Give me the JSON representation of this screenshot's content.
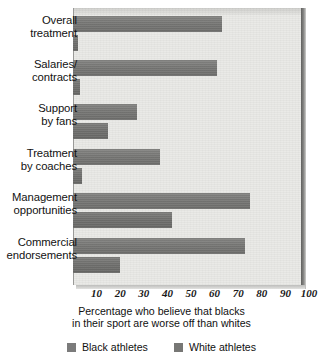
{
  "chart_data": {
    "type": "bar",
    "orientation": "horizontal",
    "title": "",
    "subtitle": "",
    "xlabel": "Percentage who believe that  blacks in their sport are worse off than whites",
    "ylabel": "",
    "xlim": [
      0,
      100
    ],
    "grid": false,
    "legend_position": "bottom",
    "categories": [
      "Overall treatment",
      "Salaries/ contracts",
      "Support by fans",
      "Treatment by coaches",
      "Management opportunities",
      "Commercial endorsements"
    ],
    "category_lines": [
      [
        "Overall",
        "treatment"
      ],
      [
        "Salaries/",
        "contracts"
      ],
      [
        "Support",
        "by fans"
      ],
      [
        "Treatment",
        "by coaches"
      ],
      [
        "Management",
        "opportunities"
      ],
      [
        "Commercial",
        "endorsements"
      ]
    ],
    "series": [
      {
        "name": "Black athletes",
        "color": "#7b7b7b",
        "values": [
          63,
          61,
          27,
          37,
          75,
          73
        ]
      },
      {
        "name": "White athletes",
        "color": "#777775",
        "values": [
          2,
          3,
          15,
          4,
          42,
          20
        ]
      }
    ],
    "xticks": [
      10,
      20,
      30,
      40,
      50,
      60,
      70,
      80,
      90,
      100
    ],
    "xtick_labels": [
      "10",
      "20",
      "30",
      "40",
      "50",
      "60",
      "70",
      "80",
      "90",
      "100"
    ]
  },
  "caption": {
    "line1": "Percentage who believe that  blacks",
    "line2": "in their sport are worse off than whites"
  },
  "legend": {
    "items": [
      {
        "label": "Black athletes",
        "swatch": "legend-swatch-black-athletes"
      },
      {
        "label": "White athletes",
        "swatch": "legend-swatch-white-athletes"
      }
    ]
  },
  "icons": {
    "black_swatch": "square-swatch-icon",
    "white_swatch": "square-swatch-icon"
  }
}
